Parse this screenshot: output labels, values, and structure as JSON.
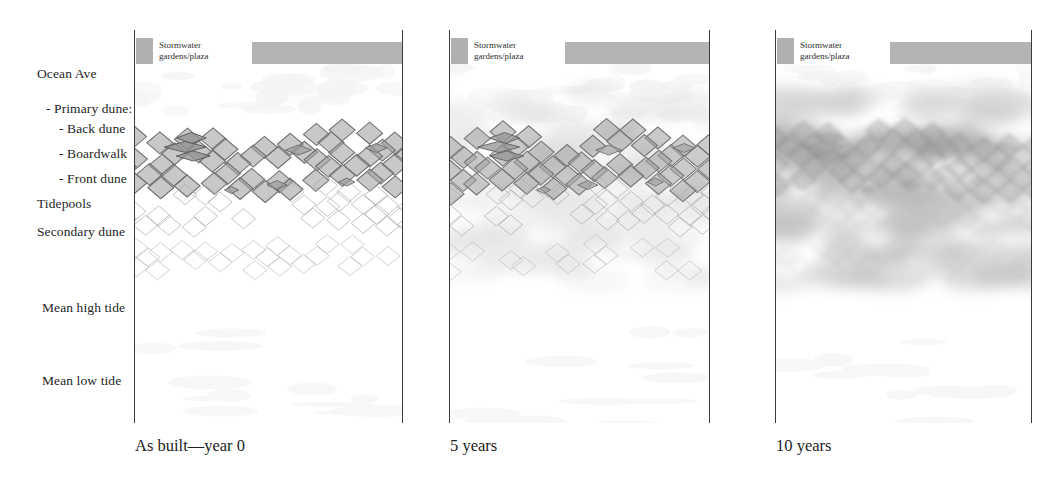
{
  "figure": {
    "type": "section-diagram",
    "title_visible": false,
    "background_color": "#ffffff",
    "ink_color": "#2b2b2b"
  },
  "row_labels": [
    {
      "id": "ocean-ave",
      "text": "Ocean Ave",
      "x": 37,
      "y": 77,
      "indent": 0
    },
    {
      "id": "primary-dune",
      "text": "- Primary dune:",
      "x": 46,
      "y": 112,
      "indent": 1
    },
    {
      "id": "back-dune",
      "text": "- Back dune",
      "x": 59,
      "y": 132,
      "indent": 2
    },
    {
      "id": "boardwalk",
      "text": "- Boardwalk",
      "x": 59,
      "y": 157,
      "indent": 2
    },
    {
      "id": "front-dune",
      "text": "- Front dune",
      "x": 59,
      "y": 182,
      "indent": 2
    },
    {
      "id": "tidepools",
      "text": "Tidepools",
      "x": 37,
      "y": 207,
      "indent": 0
    },
    {
      "id": "secondary-dune",
      "text": "Secondary dune",
      "x": 37,
      "y": 235,
      "indent": 0
    },
    {
      "id": "mean-high-tide",
      "text": "Mean high tide",
      "x": 42,
      "y": 311,
      "indent": 0
    },
    {
      "id": "mean-low-tide",
      "text": "Mean low tide",
      "x": 42,
      "y": 384,
      "indent": 0
    }
  ],
  "legend": {
    "swatch_color": "#b0b0b0",
    "bar_color": "#b4b4b4",
    "label_line1": "Stormwater",
    "label_line2": "gardens/plaza"
  },
  "panels": [
    {
      "id": "panel-year-0",
      "caption": "As built—year 0",
      "caption_x": 135,
      "caption_y": 451,
      "left": 134,
      "right": 402,
      "legend_swatch_x": 136,
      "legend_box_x": 155,
      "legend_bar_x": 252,
      "legend_bar_width": 150,
      "maturity": 0,
      "blur": 0.0,
      "hatch_opacity": 1.0,
      "soft_veg_opacity": 0.0
    },
    {
      "id": "panel-5-years",
      "caption": "5 years",
      "caption_x": 450,
      "caption_y": 451,
      "left": 449,
      "right": 709,
      "legend_swatch_x": 451,
      "legend_box_x": 470,
      "legend_bar_x": 565,
      "legend_bar_width": 144,
      "maturity": 5,
      "blur": 0.6,
      "hatch_opacity": 0.95,
      "soft_veg_opacity": 0.35
    },
    {
      "id": "panel-10-years",
      "caption": "10 years",
      "caption_x": 776,
      "caption_y": 451,
      "left": 775,
      "right": 1031,
      "legend_swatch_x": 777,
      "legend_box_x": 796,
      "legend_bar_x": 890,
      "legend_bar_width": 141,
      "maturity": 10,
      "blur": 2.2,
      "hatch_opacity": 0.62,
      "soft_veg_opacity": 0.95
    }
  ],
  "chart_data": {
    "type": "diagram",
    "caption_series": [
      "As built—year 0",
      "5 years",
      "10 years"
    ],
    "vertical_strata_top_to_bottom": [
      "Ocean Ave",
      "- Primary dune:",
      "- Back dune",
      "- Boardwalk",
      "- Front dune",
      "Tidepools",
      "Secondary dune",
      "Mean high tide",
      "Mean low tide"
    ],
    "legend_entries": [
      "Stormwater gardens/plaza"
    ]
  }
}
